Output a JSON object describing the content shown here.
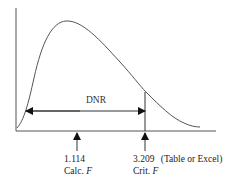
{
  "diagram": {
    "type": "F-distribution decision diagram",
    "region_label": "DNR",
    "calc": {
      "value": "1.114",
      "label": "Calc.",
      "var": "F"
    },
    "crit": {
      "value": "3.209",
      "note": "(Table or Excel)",
      "label": "Crit.",
      "var": "F"
    },
    "colors": {
      "line": "#333333",
      "curve": "#555555"
    }
  }
}
